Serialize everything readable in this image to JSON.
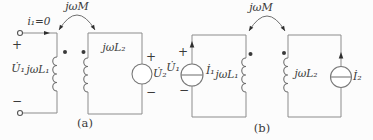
{
  "colors": {
    "wire": "#8c8c8c",
    "ink": "#3a3a3a",
    "background": "#fcfcfc"
  },
  "circuit_a": {
    "caption": "(a)",
    "mutual": "jωM",
    "current": "i₁=0",
    "port_plus": "+",
    "port_minus": "−",
    "u1": "U̇₁",
    "l1": "jωL₁",
    "l2": "jωL₂",
    "src_plus": "+",
    "src_minus": "−",
    "u2": "U̇₂"
  },
  "circuit_b": {
    "caption": "(b)",
    "mutual": "jωM",
    "port_plus": "+",
    "port_minus": "−",
    "u1": "U̇₁",
    "i1": "İ₁",
    "l1": "jωL₁",
    "l2": "jωL₂",
    "i2": "İ₂"
  }
}
